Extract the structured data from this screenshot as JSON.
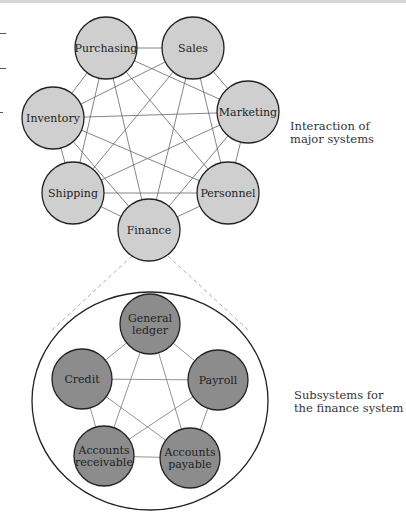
{
  "major": {
    "caption": [
      "Interaction of",
      "major systems"
    ],
    "fill": "#cfcfcf",
    "nodes": [
      {
        "label": [
          "Purchasing"
        ],
        "x": 106,
        "y": 48
      },
      {
        "label": [
          "Sales"
        ],
        "x": 193,
        "y": 48
      },
      {
        "label": [
          "Marketing"
        ],
        "x": 248,
        "y": 112
      },
      {
        "label": [
          "Personnel"
        ],
        "x": 228,
        "y": 193
      },
      {
        "label": [
          "Finance"
        ],
        "x": 149,
        "y": 230
      },
      {
        "label": [
          "Shipping"
        ],
        "x": 73,
        "y": 193
      },
      {
        "label": [
          "Inventory"
        ],
        "x": 53,
        "y": 118
      }
    ]
  },
  "finance": {
    "caption": [
      "Subsystems for",
      "the finance system"
    ],
    "fill": "#8c8c8c",
    "nodes": [
      {
        "label": [
          "General",
          "ledger"
        ],
        "x": 150,
        "y": 324
      },
      {
        "label": [
          "Payroll"
        ],
        "x": 218,
        "y": 380
      },
      {
        "label": [
          "Accounts",
          "payable"
        ],
        "x": 190,
        "y": 458
      },
      {
        "label": [
          "Accounts",
          "receivable"
        ],
        "x": 104,
        "y": 456
      },
      {
        "label": [
          "Credit"
        ],
        "x": 82,
        "y": 379
      }
    ]
  }
}
